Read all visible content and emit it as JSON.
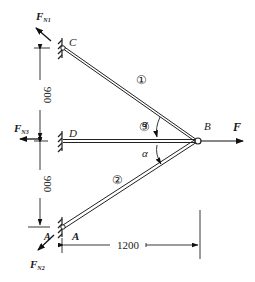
{
  "diagram": {
    "type": "truss-statics",
    "nodes": {
      "C": {
        "label": "C"
      },
      "D": {
        "label": "D"
      },
      "A": {
        "label": "A",
        "secondary_label": "A"
      },
      "B": {
        "label": "B"
      }
    },
    "members": [
      {
        "id": "1",
        "label": "①",
        "from": "C",
        "to": "B"
      },
      {
        "id": "3",
        "label": "③",
        "from": "D",
        "to": "B"
      },
      {
        "id": "2",
        "label": "②",
        "from": "A",
        "to": "B"
      }
    ],
    "angles": [
      {
        "label": "α",
        "between": [
          "1",
          "3"
        ]
      },
      {
        "label": "α",
        "between": [
          "3",
          "2"
        ]
      }
    ],
    "forces": {
      "F": {
        "label": "F",
        "sub": ""
      },
      "FN1": {
        "label": "F",
        "sub": "N1"
      },
      "FN3": {
        "label": "F",
        "sub": "N3"
      },
      "FN2": {
        "label": "F",
        "sub": "N2"
      }
    },
    "dimensions": {
      "upper_vertical": "900",
      "lower_vertical": "900",
      "horizontal": "1200"
    }
  }
}
